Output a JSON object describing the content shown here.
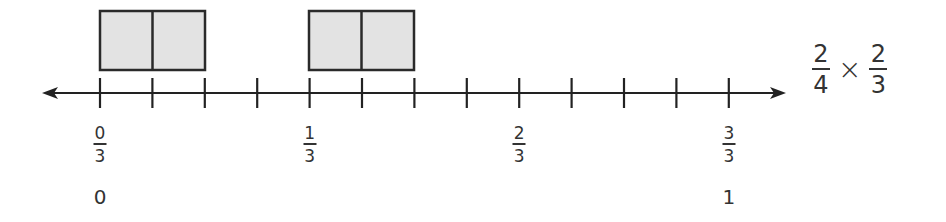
{
  "diagram": {
    "type": "number_line_fraction_model",
    "axis": {
      "y": 93,
      "x_start": 42,
      "x_end": 786,
      "color": "#222222"
    },
    "ticks": {
      "count": 13,
      "x_positions": [
        100,
        152.4,
        204.8,
        257.2,
        309.6,
        362,
        414.4,
        466.8,
        519.2,
        571.6,
        624,
        676.4,
        728.8
      ]
    },
    "boxes": [
      {
        "x": 100,
        "width": 105,
        "y": 11,
        "height": 59,
        "divisions": 2,
        "fill": "#e3e3e3"
      },
      {
        "x": 309,
        "width": 105,
        "y": 11,
        "height": 59,
        "divisions": 2,
        "fill": "#e3e3e3"
      }
    ],
    "labels": [
      {
        "numerator": "0",
        "denominator": "3",
        "x": 100,
        "whole": "0"
      },
      {
        "numerator": "1",
        "denominator": "3",
        "x": 309.6,
        "whole": ""
      },
      {
        "numerator": "2",
        "denominator": "3",
        "x": 519.2,
        "whole": ""
      },
      {
        "numerator": "3",
        "denominator": "3",
        "x": 728.8,
        "whole": "1"
      }
    ],
    "expression": {
      "left": {
        "numerator": "2",
        "denominator": "4"
      },
      "operator": "×",
      "right": {
        "numerator": "2",
        "denominator": "3"
      }
    }
  }
}
